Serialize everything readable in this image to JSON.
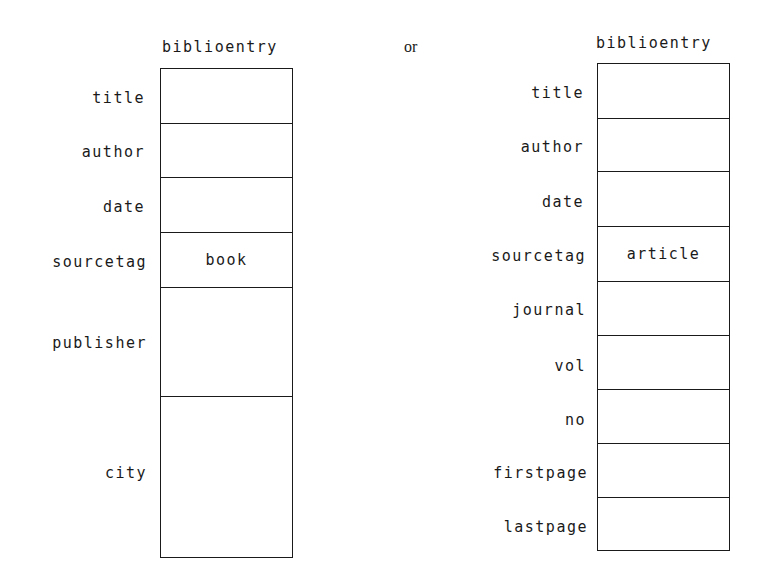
{
  "diagram": {
    "connector_text": "or",
    "left": {
      "header": "biblioentry",
      "fields": [
        {
          "label": "title",
          "value": ""
        },
        {
          "label": "author",
          "value": ""
        },
        {
          "label": "date",
          "value": ""
        },
        {
          "label": "sourcetag",
          "value": "book"
        },
        {
          "label": "publisher",
          "value": ""
        },
        {
          "label": "city",
          "value": ""
        }
      ]
    },
    "right": {
      "header": "biblioentry",
      "fields": [
        {
          "label": "title",
          "value": ""
        },
        {
          "label": "author",
          "value": ""
        },
        {
          "label": "date",
          "value": ""
        },
        {
          "label": "sourcetag",
          "value": "article"
        },
        {
          "label": "journal",
          "value": ""
        },
        {
          "label": "vol",
          "value": ""
        },
        {
          "label": "no",
          "value": ""
        },
        {
          "label": "firstpage",
          "value": ""
        },
        {
          "label": "lastpage",
          "value": ""
        }
      ]
    }
  }
}
